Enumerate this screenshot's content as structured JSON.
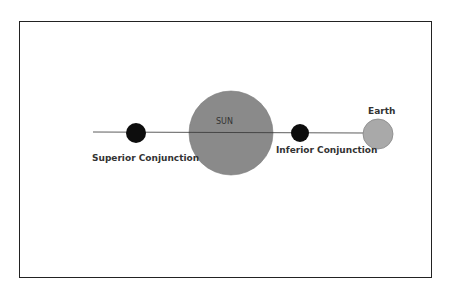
{
  "diagram": {
    "labels": {
      "sun": "SUN",
      "earth": "Earth",
      "superior": "Superior Conjunction",
      "inferior": "Inferior Conjunction"
    },
    "colors": {
      "sun": "#8a8a8a",
      "earth": "#a9a9a9",
      "planet": "#0d0d0d",
      "line": "#333333",
      "border": "#222222"
    }
  }
}
